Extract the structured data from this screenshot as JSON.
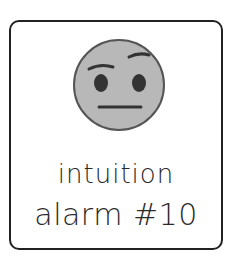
{
  "card": {
    "icon": "skeptical-face-icon",
    "line1": "intuition",
    "line2": "alarm #10"
  },
  "colors": {
    "face_fill": "#b8b8b8",
    "stroke": "#333333",
    "border": "#222222",
    "text": "#2a2a2a"
  }
}
